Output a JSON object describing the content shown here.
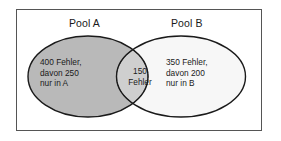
{
  "figure": {
    "type": "venn-diagram",
    "frame": {
      "border_color": "#555555",
      "background_color": "#ffffff"
    }
  },
  "labels": {
    "pool_a": "Pool A",
    "pool_b": "Pool B"
  },
  "sets": {
    "left": {
      "name": "Pool A",
      "fill_color": "#b9b9b9",
      "stroke_color": "#1a1a1a",
      "lines": [
        "400 Fehler,",
        "davon 250",
        "nur in A"
      ],
      "total": 400,
      "exclusive": 250
    },
    "right": {
      "name": "Pool B",
      "fill_color": "#f7f7f7",
      "stroke_color": "#1a1a1a",
      "lines": [
        "350 Fehler,",
        "davon 200",
        "nur in B"
      ],
      "total": 350,
      "exclusive": 200
    },
    "intersection": {
      "fill_color": "#cfcfcf",
      "stroke_color": "#4a4a4a",
      "stroke_style": "dotted",
      "lines": [
        "150",
        "Fehler"
      ],
      "count": 150
    }
  },
  "text": {
    "left_line_1": "400 Fehler,",
    "left_line_2": "davon 250",
    "left_line_3": "nur in A",
    "right_line_1": "350 Fehler,",
    "right_line_2": "davon 200",
    "right_line_3": "nur in B",
    "mid_line_1": "150",
    "mid_line_2": "Fehler"
  }
}
